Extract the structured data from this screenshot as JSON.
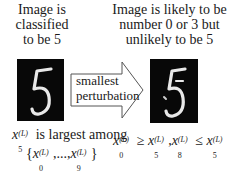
{
  "captions": {
    "left": "Image is classified to be 5",
    "right": "Image is likely to be number 0 or 3 but unlikely to be 5"
  },
  "arrow": {
    "label": "smallest perturbation",
    "icon": "right-arrow-icon"
  },
  "images": {
    "left": {
      "digit": "5",
      "description": "original MNIST digit 5"
    },
    "right": {
      "digit": "5",
      "description": "perturbed MNIST digit 5"
    }
  },
  "math": {
    "left_line1_var": "x",
    "left_line1_sub": "5",
    "left_line1_sup": "(L)",
    "left_line1_text": "is largest among",
    "left_line2": "{x0(L),...,x9(L)}",
    "left_line2_a_sub": "0",
    "left_line2_b_sub": "9",
    "sup": "(L)",
    "right": "x0(L) ≥ x5(L), x8(L) ≤ x5(L)",
    "right_subs": [
      "0",
      "5",
      "8",
      "5"
    ],
    "ge": "≥",
    "le": "≤"
  },
  "colors": {
    "image_bg": "#080808",
    "stroke": "#e8e8e8",
    "text": "#1a1a1a"
  }
}
